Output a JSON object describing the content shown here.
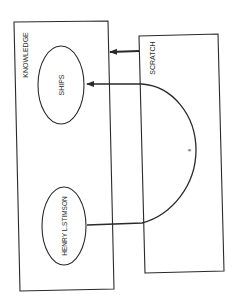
{
  "diagram": {
    "boxes": {
      "knowledge": {
        "label": "KNOWLEDGE"
      },
      "scratch": {
        "label": "SCRATCH"
      }
    },
    "nodes": {
      "ships": {
        "label": "SHIPS"
      },
      "stimson": {
        "label": "HENRY L.STIMSON"
      }
    },
    "edges": {
      "scratch_to_knowledge": {
        "label": ""
      },
      "arc": {
        "label": "e"
      }
    },
    "colors": {
      "stroke": "#2a2a2a",
      "background": "#ffffff"
    }
  }
}
